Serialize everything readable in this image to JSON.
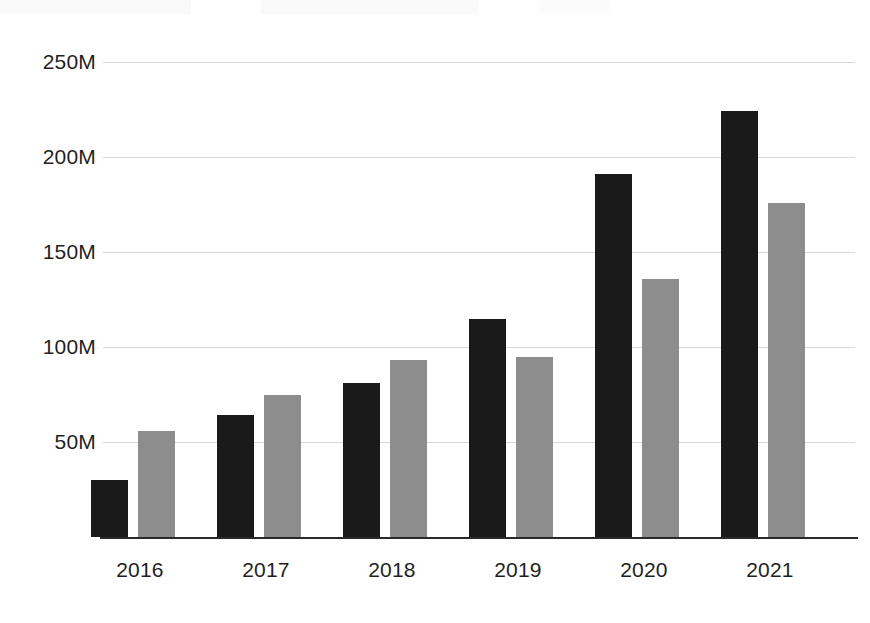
{
  "chart_data": {
    "type": "bar",
    "title": "",
    "subtitle": "",
    "xlabel": "",
    "ylabel": "",
    "categories": [
      "2016",
      "2017",
      "2018",
      "2019",
      "2020",
      "2021"
    ],
    "series": [
      {
        "name": "Series 1",
        "color": "#1a1a1a",
        "values": [
          30,
          64,
          81,
          115,
          191,
          224
        ]
      },
      {
        "name": "Series 2",
        "color": "#8d8d8d",
        "values": [
          56,
          75,
          93,
          95,
          136,
          176
        ]
      }
    ],
    "value_unit": "M",
    "ylim": [
      0,
      262
    ],
    "yticks": [
      50,
      100,
      150,
      200,
      250
    ],
    "ytick_labels": [
      "50M",
      "100M",
      "150M",
      "200M",
      "250M"
    ],
    "grid": true,
    "grid_color": "#d8d8d8",
    "legend": "none",
    "axis_color": "#2a2a2a",
    "background": "#ffffff"
  }
}
